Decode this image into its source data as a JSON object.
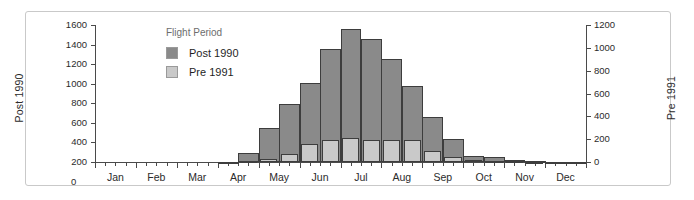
{
  "chart_data": {
    "type": "bar",
    "title": "",
    "subtitle": "",
    "xlabel": "",
    "ylabel": "Post 1990",
    "y2label": "Pre 1991",
    "grid": false,
    "legend_position": "inside-top-left",
    "legend_title": "Flight Period",
    "x_tick_labels": [
      "Jan",
      "Feb",
      "Mar",
      "Apr",
      "May",
      "Jun",
      "Jul",
      "Aug",
      "Sep",
      "Oct",
      "Nov",
      "Dec"
    ],
    "y_tick_labels": [
      "1600",
      "1400",
      "1200",
      "1000",
      "800",
      "600",
      "400",
      "200"
    ],
    "y_zero_label": "0",
    "y2_tick_labels": [
      "1200",
      "1000",
      "800",
      "600",
      "400",
      "200",
      "0"
    ],
    "ylim": [
      200,
      1600
    ],
    "y2lim": [
      0,
      1200
    ],
    "y_detached_zero": true,
    "note": "Two overlaid histograms of flight records by half-month; dark bars read on the left axis (Post 1990), light bars read on the right axis (Pre 1991).",
    "categories": [
      "Jan 1",
      "Jan 2",
      "Feb 1",
      "Feb 2",
      "Mar 1",
      "Mar 2",
      "Apr 1",
      "Apr 2",
      "May 1",
      "May 2",
      "Jun 1",
      "Jun 2",
      "Jul 1",
      "Jul 2",
      "Aug 1",
      "Aug 2",
      "Sep 1",
      "Sep 2",
      "Oct 1",
      "Oct 2",
      "Nov 1",
      "Nov 2",
      "Dec 1",
      "Dec 2"
    ],
    "series": [
      {
        "name": "Post 1990",
        "color": "#8a8a8a",
        "axis": "left",
        "values": [
          200,
          200,
          200,
          200,
          200,
          200,
          205,
          290,
          545,
          795,
          1005,
          1350,
          1560,
          1455,
          1250,
          975,
          660,
          440,
          265,
          250,
          225,
          215,
          205,
          205
        ]
      },
      {
        "name": "Pre 1991",
        "color": "#c9c9c9",
        "axis": "right",
        "values": [
          0,
          0,
          0,
          0,
          0,
          0,
          0,
          8,
          30,
          70,
          155,
          190,
          210,
          195,
          195,
          190,
          95,
          45,
          20,
          10,
          5,
          3,
          0,
          0
        ]
      }
    ]
  },
  "legend": {
    "title": "Flight Period",
    "entries": [
      {
        "label": "Post 1990",
        "color": "#8a8a8a"
      },
      {
        "label": "Pre 1991",
        "color": "#c9c9c9"
      }
    ]
  },
  "axes": {
    "left_title": "Post 1990",
    "right_title": "Pre 1991"
  },
  "colors": {
    "post_1990": "#8a8a8a",
    "pre_1991": "#c9c9c9",
    "bar_outline": "#3d3d3d",
    "axis": "#4a4a4a",
    "frame": "#c9c9c9",
    "text": "#2b2b2b",
    "legend_title_text": "#6d6d6d"
  }
}
